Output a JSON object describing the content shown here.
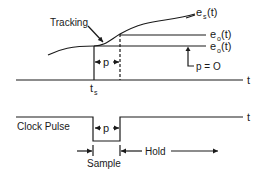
{
  "diagram": {
    "type": "sample-and-hold timing diagram",
    "signal_plot": {
      "curve_label": {
        "main": "e",
        "sub": "s",
        "suffix": "(t)"
      },
      "output_label_1": {
        "main": "e",
        "sub": "o",
        "suffix": "(t)"
      },
      "output_label_2": {
        "main": "e",
        "sub": "o",
        "suffix": "(t)"
      },
      "tracking_label": "Tracking",
      "p_label": "p",
      "p_zero_label": "p = O",
      "axis_label": "t",
      "ts_label": {
        "main": "t",
        "sub": "s"
      }
    },
    "clock_plot": {
      "title": "Clock Pulse",
      "p_label": "p",
      "axis_label": "t",
      "sample_label": "Sample",
      "hold_label": "Hold"
    }
  }
}
